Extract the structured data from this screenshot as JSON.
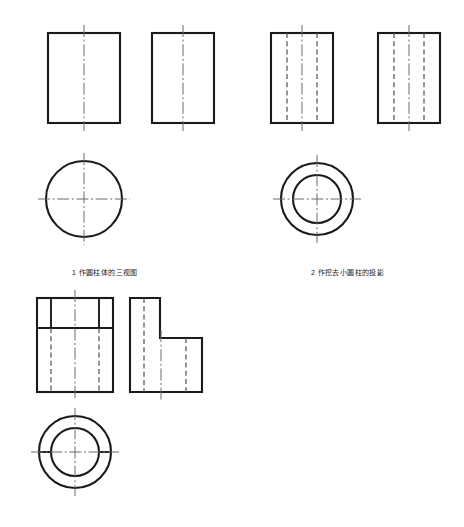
{
  "sheet": {
    "title": "圆柱体三视图画法练习",
    "background_color": "#ffffff",
    "line_color": "#1a1a1a",
    "width": 464,
    "height": 527
  },
  "figures": [
    {
      "id": "figure-1",
      "caption": "1  作圆柱体的三视图",
      "caption_number": "1",
      "caption_text": "作圆柱体的三视图",
      "description": "Three views of a plain cylinder",
      "views": [
        {
          "name": "front-view",
          "type": "rectangle",
          "x": 48,
          "y": 33,
          "width": 72,
          "height": 90,
          "centerline_vertical": true,
          "hidden_lines": []
        },
        {
          "name": "side-view",
          "type": "rectangle",
          "x": 152,
          "y": 33,
          "width": 62,
          "height": 90,
          "centerline_vertical": true,
          "hidden_lines": []
        },
        {
          "name": "top-view",
          "type": "circle",
          "cx": 84,
          "cy": 199,
          "r": 38,
          "inner_r": null,
          "centerline_vertical": true,
          "centerline_horizontal": true
        }
      ]
    },
    {
      "id": "figure-2",
      "caption": "2  作挖去小圆柱的投影",
      "caption_number": "2",
      "caption_text": "作挖去小圆柱的投影",
      "description": "Projection of cylinder with a bore removed",
      "views": [
        {
          "name": "front-view",
          "type": "rectangle",
          "x": 271,
          "y": 33,
          "width": 62,
          "height": 90,
          "centerline_vertical": true,
          "hidden_lines": [
            287,
            317
          ]
        },
        {
          "name": "side-view",
          "type": "rectangle",
          "x": 378,
          "y": 33,
          "width": 62,
          "height": 90,
          "centerline_vertical": true,
          "hidden_lines": [
            394,
            424
          ]
        },
        {
          "name": "top-view",
          "type": "circle",
          "cx": 317,
          "cy": 199,
          "r": 36,
          "inner_r": 24,
          "centerline_vertical": true,
          "centerline_horizontal": true
        }
      ]
    },
    {
      "id": "figure-3",
      "caption": "",
      "description": "Cylinder with bore and top notch cut",
      "views": [
        {
          "name": "front-view",
          "type": "notched-rectangle",
          "x": 37,
          "y": 298,
          "width": 76,
          "height": 94,
          "notch_line_y": 328,
          "notch_left_x": 51,
          "notch_right_x": 99,
          "centerline_vertical": true,
          "hidden_lines": [
            51,
            99
          ]
        },
        {
          "name": "side-view",
          "type": "l-shape",
          "x": 130,
          "y": 298,
          "width": 72,
          "height": 94,
          "step_x": 160,
          "step_y": 338,
          "centerline_vertical": true,
          "hidden_lines": [
            144,
            186
          ]
        },
        {
          "name": "top-view",
          "type": "circle-with-chords",
          "cx": 75,
          "cy": 452,
          "r": 36,
          "inner_r": 24,
          "centerline_vertical": true,
          "centerline_horizontal": true,
          "chord_segments": 2
        }
      ]
    }
  ],
  "line_styles": {
    "visible": "solid",
    "hidden": "dashed",
    "center": "dash-dot"
  }
}
